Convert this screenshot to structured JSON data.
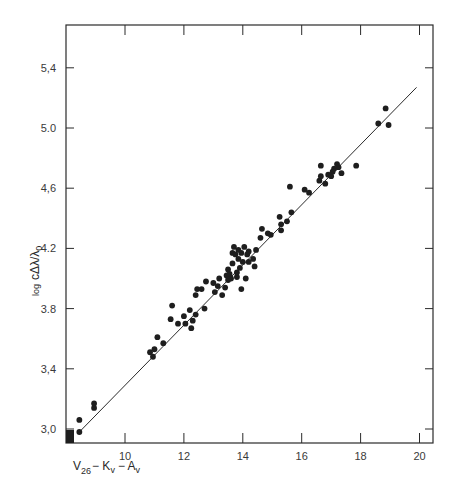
{
  "chart_data": {
    "type": "scatter",
    "title": "",
    "xlabel": "V26 − Kv − Av",
    "xlabel_parts": {
      "v": "V",
      "v_sub": "26",
      "k": "− K",
      "k_sub": "v",
      "a": "− A",
      "a_sub": "v"
    },
    "ylabel": "log cΔλ/λ0",
    "ylabel_parts": {
      "log": "log",
      "main": "cΔλ/λ",
      "sub": "0"
    },
    "xlim": [
      8.0,
      20.5
    ],
    "ylim": [
      2.92,
      5.7
    ],
    "x_ticks": [
      10,
      12,
      14,
      16,
      18,
      20
    ],
    "x_tick_labels": [
      "10",
      "12",
      "14",
      "16",
      "18",
      "20"
    ],
    "y_ticks": [
      3.0,
      3.4,
      3.8,
      4.2,
      4.6,
      5.0,
      5.4
    ],
    "y_tick_labels": [
      "3,0",
      "3,4",
      "3.8",
      "4.2",
      "4,6",
      "5.0",
      "5,4"
    ],
    "grid": false,
    "legend": null,
    "fit_line": {
      "x": [
        8.4,
        19.9
      ],
      "y": [
        2.97,
        5.27
      ]
    },
    "corner_marker": {
      "x": 8.0,
      "y": 2.92,
      "label": "filled square at origin"
    },
    "points": [
      [
        8.45,
        3.06
      ],
      [
        8.45,
        2.98
      ],
      [
        8.95,
        3.17
      ],
      [
        8.95,
        3.14
      ],
      [
        10.85,
        3.51
      ],
      [
        10.95,
        3.48
      ],
      [
        11.0,
        3.53
      ],
      [
        11.1,
        3.61
      ],
      [
        11.3,
        3.57
      ],
      [
        11.55,
        3.73
      ],
      [
        11.6,
        3.82
      ],
      [
        11.8,
        3.7
      ],
      [
        12.0,
        3.75
      ],
      [
        12.05,
        3.7
      ],
      [
        12.2,
        3.79
      ],
      [
        12.25,
        3.67
      ],
      [
        12.3,
        3.72
      ],
      [
        12.4,
        3.76
      ],
      [
        12.4,
        3.89
      ],
      [
        12.45,
        3.93
      ],
      [
        12.6,
        3.93
      ],
      [
        12.7,
        3.8
      ],
      [
        12.75,
        3.98
      ],
      [
        13.0,
        3.97
      ],
      [
        13.05,
        3.91
      ],
      [
        13.15,
        3.95
      ],
      [
        13.2,
        4.0
      ],
      [
        13.3,
        3.89
      ],
      [
        13.4,
        3.94
      ],
      [
        13.45,
        4.02
      ],
      [
        13.5,
        4.06
      ],
      [
        13.5,
        3.99
      ],
      [
        13.55,
        4.03
      ],
      [
        13.6,
        4.0
      ],
      [
        13.65,
        4.1
      ],
      [
        13.65,
        4.17
      ],
      [
        13.7,
        4.21
      ],
      [
        13.75,
        4.16
      ],
      [
        13.8,
        4.01
      ],
      [
        13.8,
        4.04
      ],
      [
        13.85,
        4.13
      ],
      [
        13.85,
        4.19
      ],
      [
        13.9,
        4.07
      ],
      [
        13.95,
        4.17
      ],
      [
        13.95,
        3.93
      ],
      [
        14.0,
        4.11
      ],
      [
        14.05,
        4.21
      ],
      [
        14.1,
        4.0
      ],
      [
        14.15,
        4.16
      ],
      [
        14.2,
        4.18
      ],
      [
        14.2,
        4.11
      ],
      [
        14.35,
        4.13
      ],
      [
        14.4,
        4.08
      ],
      [
        14.45,
        4.19
      ],
      [
        14.6,
        4.27
      ],
      [
        14.65,
        4.33
      ],
      [
        14.85,
        4.3
      ],
      [
        14.95,
        4.29
      ],
      [
        15.25,
        4.41
      ],
      [
        15.3,
        4.36
      ],
      [
        15.3,
        4.32
      ],
      [
        15.5,
        4.38
      ],
      [
        15.6,
        4.61
      ],
      [
        15.65,
        4.44
      ],
      [
        16.1,
        4.59
      ],
      [
        16.25,
        4.57
      ],
      [
        16.6,
        4.65
      ],
      [
        16.65,
        4.75
      ],
      [
        16.65,
        4.68
      ],
      [
        16.8,
        4.63
      ],
      [
        16.9,
        4.69
      ],
      [
        17.0,
        4.68
      ],
      [
        17.05,
        4.71
      ],
      [
        17.1,
        4.73
      ],
      [
        17.2,
        4.76
      ],
      [
        17.25,
        4.74
      ],
      [
        17.35,
        4.7
      ],
      [
        17.85,
        4.75
      ],
      [
        18.6,
        5.03
      ],
      [
        18.85,
        5.13
      ],
      [
        18.95,
        5.02
      ]
    ]
  }
}
